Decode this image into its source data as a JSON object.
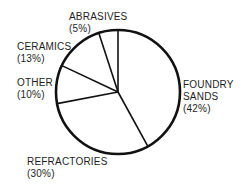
{
  "chart_data": {
    "type": "pie",
    "title": "",
    "start_angle_deg": 0,
    "direction": "clockwise",
    "center": [
      118,
      92
    ],
    "radius": 62,
    "stroke_color": "#111111",
    "fill_color": "#ffffff",
    "slices": [
      {
        "label": "FOUNDRY SANDS",
        "value": 42,
        "pct_text": "(42%)"
      },
      {
        "label": "REFRACTORIES",
        "value": 30,
        "pct_text": "(30%)"
      },
      {
        "label": "OTHER",
        "value": 10,
        "pct_text": "(10%)"
      },
      {
        "label": "CERAMICS",
        "value": 13,
        "pct_text": "(13%)"
      },
      {
        "label": "ABRASIVES",
        "value": 5,
        "pct_text": "(5%)"
      }
    ]
  },
  "labels": {
    "foundry": {
      "line1": "FOUNDRY",
      "line2": "SANDS",
      "line3": "(42%)"
    },
    "refractories": {
      "line1": "REFRACTORIES",
      "line2": "(30%)"
    },
    "other": {
      "line1": "OTHER",
      "line2": "(10%)"
    },
    "ceramics": {
      "line1": "CERAMICS",
      "line2": "(13%)"
    },
    "abrasives": {
      "line1": "ABRASIVES",
      "line2": "(5%)"
    }
  }
}
